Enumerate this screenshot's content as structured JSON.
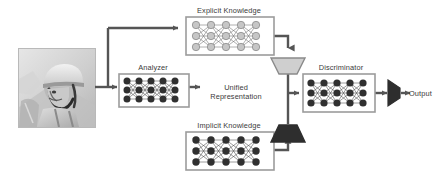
{
  "diagram": {
    "background_color": "#ffffff",
    "line_color": "#555555",
    "text_color": "#3a3a3a",
    "nodes": [
      {
        "id": "input-image",
        "type": "image-thumbnail",
        "label": "",
        "description": "grayscale photograph of a person wearing a helmet"
      },
      {
        "id": "explicit-knowledge",
        "type": "neural-network-box",
        "label": "Explicit Knowledge",
        "node_color": "#c4c4c4",
        "rows": 3,
        "columns": 5
      },
      {
        "id": "analyzer",
        "type": "neural-network-box",
        "label": "Analyzer",
        "node_color": "#333333",
        "rows": 3,
        "columns": 5
      },
      {
        "id": "implicit-knowledge",
        "type": "neural-network-box",
        "label": "Implicit Knowledge",
        "node_color": "#333333",
        "rows": 3,
        "columns": 5
      },
      {
        "id": "unified-representation",
        "type": "text-label",
        "label": "Unified Representation",
        "line_1": "Unified",
        "line_2": "Representation"
      },
      {
        "id": "merge-top",
        "type": "trapezoid-down",
        "label": "",
        "fill_color": "#cfcfcf"
      },
      {
        "id": "merge-bottom",
        "type": "trapezoid-up",
        "label": "",
        "fill_color": "#2e2e2e"
      },
      {
        "id": "discriminator",
        "type": "neural-network-box",
        "label": "Discriminator",
        "node_color": "#333333",
        "rows": 3,
        "columns": 5
      },
      {
        "id": "output-mux",
        "type": "mux-right",
        "label": "",
        "fill_color": "#2e2e2e"
      },
      {
        "id": "output",
        "type": "text-label",
        "label": "Output"
      }
    ],
    "edges": [
      {
        "from": "input-image",
        "to": "analyzer"
      },
      {
        "from": "input-image",
        "to": "explicit-knowledge"
      },
      {
        "from": "explicit-knowledge",
        "to": "merge-top"
      },
      {
        "from": "analyzer",
        "to": "unified-representation"
      },
      {
        "from": "implicit-knowledge",
        "to": "merge-bottom"
      },
      {
        "from": "unified-representation",
        "to": "discriminator"
      },
      {
        "from": "discriminator",
        "to": "output-mux"
      },
      {
        "from": "output-mux",
        "to": "output"
      }
    ]
  }
}
